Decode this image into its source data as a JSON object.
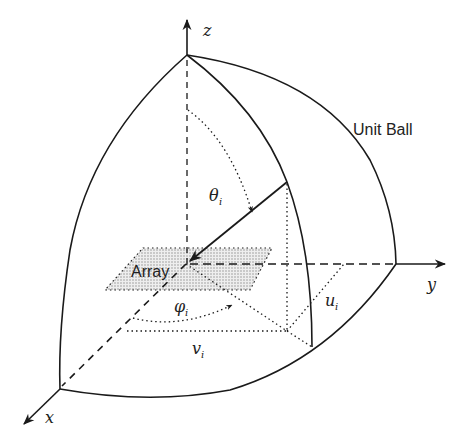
{
  "figure": {
    "title": "Unit Ball",
    "axes": {
      "x_label": "x",
      "y_label": "y",
      "z_label": "z"
    },
    "annotations": {
      "theta": "θ",
      "theta_sub": "i",
      "phi": "φ",
      "phi_sub": "i",
      "u": "u",
      "u_sub": "i",
      "v": "v",
      "v_sub": "i",
      "array_label": "Array"
    },
    "colors": {
      "line": "#1a1a1a",
      "array_fill": "#d9d9d9",
      "background": "#ffffff"
    }
  }
}
